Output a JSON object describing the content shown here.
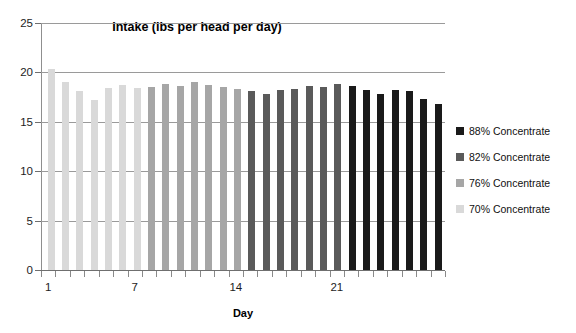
{
  "chart_data": {
    "type": "bar",
    "title": "Intake (lbs per head per day)",
    "xlabel": "Day",
    "ylabel": "",
    "ylim": [
      0,
      25
    ],
    "ytick_values": [
      0,
      5,
      10,
      15,
      20,
      25
    ],
    "ytick_labels": [
      "0",
      "5",
      "10",
      "15",
      "20",
      "25"
    ],
    "xtick_labels": [
      "1",
      "7",
      "14",
      "21"
    ],
    "xtick_days": [
      1,
      7,
      14,
      21
    ],
    "grid": true,
    "legend_position": "right",
    "categories": [
      1,
      2,
      3,
      4,
      5,
      6,
      7,
      8,
      9,
      10,
      11,
      12,
      13,
      14,
      15,
      16,
      17,
      18,
      19,
      20,
      21,
      22,
      23,
      24,
      25,
      26,
      27,
      28
    ],
    "values": [
      20.3,
      19.0,
      18.1,
      17.2,
      18.4,
      18.7,
      18.4,
      18.5,
      18.8,
      18.6,
      19.0,
      18.7,
      18.5,
      18.3,
      18.1,
      17.8,
      18.2,
      18.3,
      18.6,
      18.5,
      18.8,
      18.6,
      18.2,
      17.8,
      18.2,
      18.1,
      17.3,
      16.8
    ],
    "bar_groups": [
      {
        "name": "70% Concentrate",
        "color": "#d9d9d9",
        "days": [
          1,
          2,
          3,
          4,
          5,
          6,
          7
        ]
      },
      {
        "name": "76% Concentrate",
        "color": "#a6a6a6",
        "days": [
          8,
          9,
          10,
          11,
          12,
          13,
          14
        ]
      },
      {
        "name": "82% Concentrate",
        "color": "#5a5a5a",
        "days": [
          15,
          16,
          17,
          18,
          19,
          20,
          21
        ]
      },
      {
        "name": "88% Concentrate",
        "color": "#1a1a1a",
        "days": [
          22,
          23,
          24,
          25,
          26,
          27,
          28
        ]
      }
    ],
    "series_colors": {
      "70": "#d9d9d9",
      "76": "#a6a6a6",
      "82": "#5a5a5a",
      "88": "#1a1a1a"
    },
    "legend": [
      {
        "label": "88% Concentrate",
        "color": "#1a1a1a"
      },
      {
        "label": "82% Concentrate",
        "color": "#5a5a5a"
      },
      {
        "label": "76% Concentrate",
        "color": "#a6a6a6"
      },
      {
        "label": "70% Concentrate",
        "color": "#d9d9d9"
      }
    ]
  }
}
